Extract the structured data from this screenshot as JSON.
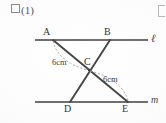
{
  "figure": {
    "problem_label": "(1)",
    "problem_box_icon": "empty-square-icon",
    "corner_mark_icon": "bracket-fragment-icon",
    "type": "geometry-diagram",
    "vertex_labels": {
      "A": "A",
      "B": "B",
      "C": "C",
      "D": "D",
      "E": "E"
    },
    "line_labels": {
      "top": "ℓ",
      "bottom": "m"
    },
    "length_labels": {
      "AC": "6cm",
      "CE": "6cm"
    },
    "colors": {
      "ink": "#3b3b3b",
      "rule": "#6f6f6f",
      "segment": "#4a4a4a",
      "dashed": "#9a9a9a",
      "paper": "#fdfdfd"
    },
    "geometry": {
      "line_top": {
        "x1": 35,
        "y1": 40,
        "x2": 148,
        "y2": 40,
        "label": "ℓ"
      },
      "line_bottom": {
        "x1": 35,
        "y1": 102,
        "x2": 148,
        "y2": 102,
        "label": "m"
      },
      "points": {
        "A": {
          "x": 53,
          "y": 40
        },
        "B": {
          "x": 110,
          "y": 40
        },
        "C": {
          "x": 89,
          "y": 70
        },
        "D": {
          "x": 70,
          "y": 102
        },
        "E": {
          "x": 128,
          "y": 102
        }
      },
      "segments": [
        {
          "from": "A",
          "to": "E"
        },
        {
          "from": "B",
          "to": "D"
        }
      ],
      "arcs": [
        {
          "from": "A",
          "to": "C",
          "length": "6cm",
          "style": "dashed"
        },
        {
          "from": "C",
          "to": "E",
          "length": "6cm",
          "style": "dashed"
        }
      ]
    }
  }
}
